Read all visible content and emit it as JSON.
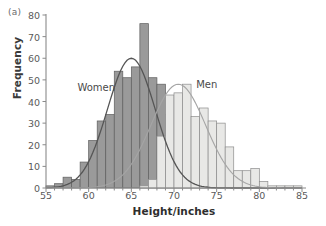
{
  "figure": {
    "panel_label": "(a)",
    "xlabel": "Height/inches",
    "ylabel": "Frequency"
  },
  "annotations": {
    "women_label": "Women",
    "men_label": "Men"
  },
  "colors": {
    "women_fill": "#9a9a9a",
    "women_edge": "#5e5e5e",
    "men_fill": "#e8e8e6",
    "men_edge": "#8c8c8c",
    "women_curve": "#555555",
    "men_curve": "#a5a5a5",
    "axis": "#8a8a8a",
    "text": "#4a4a4a"
  },
  "chart_data": {
    "type": "bar",
    "title": "",
    "subtitle": "",
    "panel": "(a)",
    "xlabel": "Height/inches",
    "ylabel": "Frequency",
    "xlim": [
      55,
      85
    ],
    "ylim": [
      0,
      80
    ],
    "xticks": [
      55,
      60,
      65,
      70,
      75,
      80,
      85
    ],
    "yticks": [
      0,
      10,
      20,
      30,
      40,
      50,
      60,
      70,
      80
    ],
    "minor_xtick_step": 1,
    "grid": false,
    "legend_position": "inline-annotation",
    "bin_width": 1,
    "overlap": "overlaid",
    "series": [
      {
        "name": "Women",
        "fill": "#9a9a9a",
        "bin_starts": [
          55,
          56,
          57,
          58,
          59,
          60,
          61,
          62,
          63,
          64,
          65,
          66,
          67,
          68,
          69,
          70,
          71,
          72,
          73,
          74,
          75,
          76
        ],
        "values": [
          1,
          2,
          5,
          4,
          12,
          22,
          31,
          34,
          54,
          51,
          56,
          76,
          51,
          48,
          34,
          24,
          17,
          10,
          5,
          2,
          1,
          1
        ]
      },
      {
        "name": "Men",
        "fill": "#e8e8e6",
        "bin_starts": [
          66,
          67,
          68,
          69,
          70,
          71,
          72,
          73,
          74,
          75,
          76,
          77,
          78,
          79,
          80,
          81,
          82,
          83,
          84
        ],
        "values": [
          1,
          4,
          24,
          43,
          44,
          48,
          33,
          37,
          31,
          30,
          19,
          8,
          8,
          9,
          3,
          1,
          1,
          1,
          1
        ]
      }
    ],
    "curves": [
      {
        "name": "Women normal curve",
        "color": "#555555",
        "mean": 65.0,
        "peak_value": 60,
        "sd": 2.8
      },
      {
        "name": "Men normal curve",
        "color": "#a5a5a5",
        "mean": 70.5,
        "peak_value": 48,
        "sd": 3.2
      }
    ],
    "annotations": [
      {
        "text": "Women",
        "x": 61.5,
        "y": 46
      },
      {
        "text": "Men",
        "x": 74.0,
        "y": 47
      }
    ]
  }
}
